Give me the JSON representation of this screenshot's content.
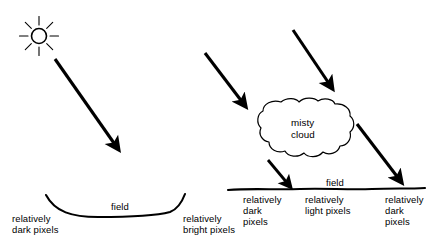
{
  "figure": {
    "background_color": "#ffffff",
    "ink_color": "#000000",
    "panels": [
      {
        "id": "left-panel",
        "description": "Direct sunlight on a concave field"
      },
      {
        "id": "right-panel",
        "description": "Sunlight partly blocked by a misty cloud over a flat field"
      }
    ]
  },
  "left_panel": {
    "sun_icon": "sun-icon",
    "sun_rays": 8,
    "sunbeam_arrow": "sunbeam-arrow",
    "ground_label": "field",
    "left_label": "relatively\ndark pixels",
    "right_label": "relatively\nbright pixels"
  },
  "right_panel": {
    "sunbeam_arrow_left": "sunbeam-arrow-left",
    "sunbeam_arrow_right": "sunbeam-arrow-right",
    "cloud_icon": "cloud-icon",
    "cloud_label": "misty\ncloud",
    "cloud_beam_arrow": "diffuse-light-arrow",
    "ground_label": "field",
    "label_dark_left": "relatively\ndark\npixels",
    "label_light_center": "relatively\nlight pixels",
    "label_dark_right": "relatively\ndark\npixels"
  }
}
